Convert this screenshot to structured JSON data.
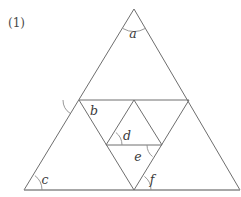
{
  "figure": {
    "problem_number": "(1)",
    "shape": "equilateral-triangle-midpoint-subdivision",
    "angle_labels": [
      {
        "id": "a",
        "text": "a",
        "x": 133,
        "y": 38,
        "vertex": "apex"
      },
      {
        "id": "b",
        "text": "b",
        "x": 94,
        "y": 115,
        "vertex": "left-midpoint"
      },
      {
        "id": "d",
        "text": "d",
        "x": 127,
        "y": 140,
        "vertex": "inner-left-midpoint"
      },
      {
        "id": "e",
        "text": "e",
        "x": 138,
        "y": 161,
        "vertex": "inner-right-midpoint"
      },
      {
        "id": "c",
        "text": "c",
        "x": 45,
        "y": 184,
        "vertex": "bottom-left"
      },
      {
        "id": "f",
        "text": "f",
        "x": 152,
        "y": 184,
        "vertex": "bottom-middle"
      }
    ],
    "colors": {
      "stroke": "#6e6e6e",
      "base_stroke": "#8a8a8a",
      "arc": "#8c8c8c",
      "label_text": "#3a3a3a",
      "background": "#ffffff"
    },
    "vertices": {
      "apex": [
        134,
        9
      ],
      "bottom_left": [
        24,
        190
      ],
      "bottom_right": [
        240,
        190
      ],
      "left_midpoint": [
        79,
        100
      ],
      "right_midpoint": [
        189,
        100
      ],
      "bottom_midpoint": [
        134,
        190
      ],
      "inner_left": [
        106,
        145
      ],
      "inner_right": [
        162,
        145
      ]
    }
  }
}
